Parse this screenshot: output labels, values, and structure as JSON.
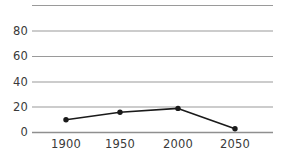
{
  "chart_data": {
    "type": "line",
    "title": "",
    "subtitle": "",
    "xlabel": "",
    "ylabel": "",
    "x": [
      1900,
      1950,
      2000,
      2050
    ],
    "categories": [
      "1900",
      "1950",
      "2000",
      "2050"
    ],
    "values": [
      10,
      16,
      19,
      3
    ],
    "series": [
      {
        "name": "",
        "values": [
          10,
          16,
          19,
          3
        ],
        "color": "#1a1a1a",
        "marker": "circle",
        "line_width": 1.5
      }
    ],
    "xlim": [
      1875,
      2075
    ],
    "ylim": [
      0,
      100
    ],
    "yticks": [
      0,
      20,
      40,
      60,
      80
    ],
    "ytick_labels": [
      "0",
      "20",
      "40",
      "60",
      "80"
    ],
    "xticks": [
      1900,
      1950,
      2000,
      2050
    ],
    "xtick_labels": [
      "1900",
      "1950",
      "2000",
      "2050"
    ],
    "gridlines_y": [
      0,
      20,
      40,
      60,
      80,
      100
    ],
    "grid": true,
    "grid_color": "#9a9a9a",
    "legend": false,
    "legend_position": "none",
    "annotations": [],
    "axis_label_color": "#3a3a3a",
    "background_color": "#ffffff"
  }
}
